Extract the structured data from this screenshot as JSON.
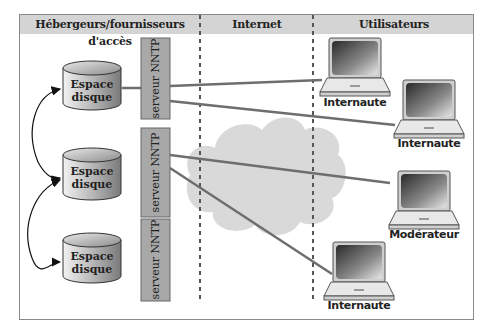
{
  "header": {
    "columns": [
      {
        "label": "Hébergeurs/fournisseurs d'accès"
      },
      {
        "label": "Internet"
      },
      {
        "label": "Utilisateurs"
      }
    ]
  },
  "storage": [
    {
      "label_line1": "Espace",
      "label_line2": "disque"
    },
    {
      "label_line1": "Espace",
      "label_line2": "disque"
    },
    {
      "label_line1": "Espace",
      "label_line2": "disque"
    }
  ],
  "servers": [
    {
      "label": "serveur NNTP"
    },
    {
      "label": "serveur NNTP"
    },
    {
      "label": "serveur NNTP"
    }
  ],
  "users": [
    {
      "label": "Internaute"
    },
    {
      "label": "Internaute"
    },
    {
      "label": "Modérateur"
    },
    {
      "label": "Internaute"
    }
  ],
  "colors": {
    "header_bg": "#d4d4d4",
    "server_fill": "#a8a8a8",
    "cloud_fill": "#d9d9d9",
    "link_line": "#6e6e6e",
    "divider": "#555555"
  }
}
